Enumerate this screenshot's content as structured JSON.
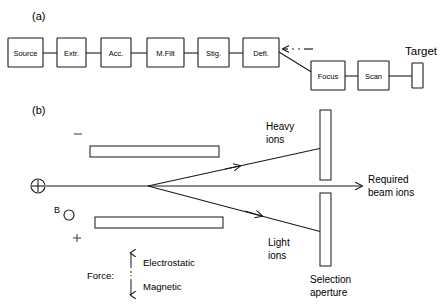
{
  "figure": {
    "panel_a_label": "(a)",
    "panel_b_label": "(b)"
  },
  "beamline": {
    "stages": [
      {
        "id": "source",
        "label": "Source"
      },
      {
        "id": "extractor",
        "label": "Extr."
      },
      {
        "id": "accelerator",
        "label": "Acc."
      },
      {
        "id": "mass-filter",
        "label": "M.Filt"
      },
      {
        "id": "stigmator",
        "label": "Stig."
      },
      {
        "id": "deflector",
        "label": "Defl."
      },
      {
        "id": "focus",
        "label": "Focus"
      },
      {
        "id": "scan",
        "label": "Scan"
      }
    ],
    "target_label": "Target"
  },
  "separator": {
    "electrode_minus": "–",
    "electrode_plus": "+",
    "magnetic_field_label": "B",
    "rays": [
      {
        "id": "heavy-ions",
        "label_line1": "Heavy",
        "label_line2": "ions"
      },
      {
        "id": "required-beam-ions",
        "label_line1": "Required",
        "label_line2": "beam ions"
      },
      {
        "id": "light-ions",
        "label_line1": "Light",
        "label_line2": "ions"
      }
    ],
    "aperture_label_line1": "Selection",
    "aperture_label_line2": "aperture"
  },
  "force_legend": {
    "title": "Force:",
    "up_label": "Electrostatic",
    "down_label": "Magnetic"
  },
  "colors": {
    "ink": "#1a1a1a",
    "background": "#ffffff"
  }
}
